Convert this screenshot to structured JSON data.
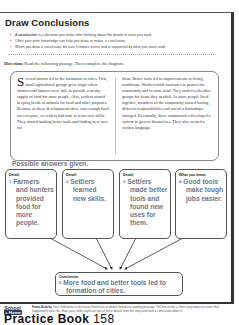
{
  "header": {
    "title": "Draw Conclusions"
  },
  "bullets": [
    {
      "bold": "conclusion",
      "pre": "A ",
      "post": " is a decision you make after thinking about the details in what you read."
    },
    {
      "text": "Often your prior knowledge can help you draw, or make, a conclusion."
    },
    {
      "text": "When you draw a conclusion, be sure it makes sense and is supported by what you have read."
    }
  ],
  "directions": {
    "label": "Directions",
    "text": " Read the following passage. Then complete the diagram."
  },
  "passage": {
    "dropcap": "S",
    "left": "everal factors led to the formation of cities. First, small agricultural groups grew larger when farmers and hunters were able to provide a steady supply of food for more people. Also, settlers started keeping herds of animals for food and other purposes. Because of these developments there was enough food for everyone, so settlers had time to learn new skills. They started making better tools and finding new uses for",
    "right": "them. Better tools led to improvements in living conditions. Workers built structures to protect the community and to store food. They traded with other groups for items they needed. As more people lived together, members of the community started having different responsibilities and social relationships changed. Eventually, these communities developed a system to govern themselves. They also created a written language."
  },
  "possible_answers": "Possible answers given.",
  "diagram": {
    "boxes": [
      {
        "label": "Detail:",
        "num": "1.",
        "first": "Farmers",
        "rest": [
          "and hunters",
          "provided",
          "food for",
          "more",
          "people."
        ]
      },
      {
        "label": "Detail:",
        "num": "2.",
        "first": "Settlers",
        "rest": [
          "learned",
          "new skills."
        ]
      },
      {
        "label": "Detail:",
        "num": "3.",
        "first": "Settlers",
        "rest": [
          "made better",
          "tools and",
          "found new",
          "uses for",
          "them."
        ]
      },
      {
        "label": "What you know:",
        "num": "4.",
        "first": "Good tools",
        "rest": [
          "make tough",
          "jobs easier."
        ]
      }
    ],
    "conclusion": {
      "label": "Conclusion",
      "num": "5.",
      "first": "More food and better tools led to",
      "rest": [
        "formation of cities."
      ]
    }
  },
  "home_activity": {
    "logo_top": "School",
    "logo_bottom": "+ Home",
    "label": "Home Activity",
    "text": " Your child drew a conclusion from facts or details found in a reading passage. Tell him or her a short story about an event that happened in your life. Have your child single out two or three details from the story and form a conclusion about it."
  },
  "footer": {
    "text": "Practice Book",
    "page": "158"
  },
  "colors": {
    "answer": "#6e7787",
    "border": "#333333"
  }
}
